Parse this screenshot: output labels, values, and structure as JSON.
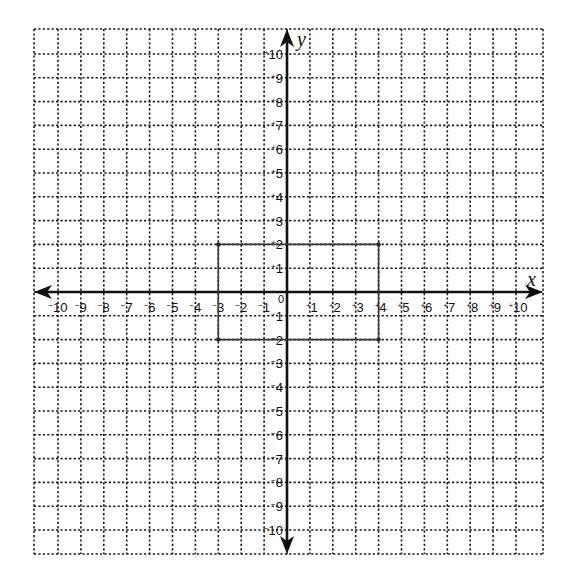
{
  "chart_data": {
    "type": "scatter",
    "title": "",
    "subtitle": "",
    "xlabel": "x",
    "ylabel": "y",
    "xlim": [
      -10,
      10
    ],
    "ylim": [
      -10,
      10
    ],
    "grid": true,
    "grid_style": "dotted",
    "legend": null,
    "origin_label": "0",
    "x_tick_labels": [
      "-10",
      "-9",
      "-8",
      "-7",
      "-6",
      "-5",
      "-4",
      "-3",
      "-2",
      "-1",
      "+1",
      "+2",
      "+3",
      "+4",
      "+5",
      "+6",
      "+7",
      "+8",
      "+9",
      "+10"
    ],
    "y_tick_labels": [
      "+10",
      "+9",
      "+8",
      "+7",
      "+6",
      "+5",
      "+4",
      "+3",
      "+2",
      "+1",
      "-1",
      "-2",
      "-3",
      "-4",
      "-5",
      "-6",
      "-7",
      "-8",
      "-9",
      "-10"
    ],
    "series": [
      {
        "name": "hand-drawn rectangle",
        "kind": "polygon",
        "points": [
          {
            "x": -3,
            "y": 2
          },
          {
            "x": 4,
            "y": 2
          },
          {
            "x": 4,
            "y": -2
          },
          {
            "x": -3,
            "y": -2
          }
        ],
        "closed": true,
        "color": "#3a3a3a"
      }
    ]
  },
  "axes": {
    "x_name": "x",
    "y_name": "y",
    "origin": "0"
  },
  "colors": {
    "background": "#ffffff",
    "grid": "#1a1a1a",
    "axis": "#111111",
    "shape": "#3a3a3a"
  }
}
